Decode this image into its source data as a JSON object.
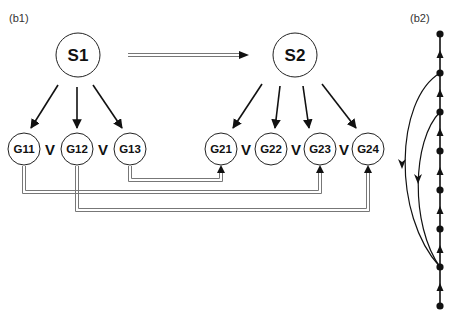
{
  "panels": {
    "b1": {
      "label": "(b1)"
    },
    "b2": {
      "label": "(b2)"
    }
  },
  "b1": {
    "states": [
      {
        "id": "S1",
        "label": "S1",
        "cx": 78,
        "cy": 55,
        "r": 22
      },
      {
        "id": "S2",
        "label": "S2",
        "cx": 295,
        "cy": 55,
        "r": 22
      }
    ],
    "goals": [
      {
        "id": "G11",
        "label": "G11",
        "cx": 24,
        "cy": 149,
        "r": 16,
        "parent": "S1"
      },
      {
        "id": "G12",
        "label": "G12",
        "cx": 77,
        "cy": 149,
        "r": 16,
        "parent": "S1"
      },
      {
        "id": "G13",
        "label": "G13",
        "cx": 130,
        "cy": 149,
        "r": 16,
        "parent": "S1"
      },
      {
        "id": "G21",
        "label": "G21",
        "cx": 221,
        "cy": 149,
        "r": 16,
        "parent": "S2"
      },
      {
        "id": "G22",
        "label": "G22",
        "cx": 271,
        "cy": 149,
        "r": 16,
        "parent": "S2"
      },
      {
        "id": "G23",
        "label": "G23",
        "cx": 320,
        "cy": 149,
        "r": 16,
        "parent": "S2"
      },
      {
        "id": "G24",
        "label": "G24",
        "cx": 368,
        "cy": 149,
        "r": 16,
        "parent": "S2"
      }
    ],
    "or_separators": [
      {
        "label": "V",
        "x": 50,
        "y": 155
      },
      {
        "label": "V",
        "x": 103,
        "y": 155
      },
      {
        "label": "V",
        "x": 246,
        "y": 155
      },
      {
        "label": "V",
        "x": 296,
        "y": 155
      },
      {
        "label": "V",
        "x": 344,
        "y": 155
      }
    ],
    "transition_arrow": {
      "from": "S1",
      "to": "S2"
    },
    "mappings": [
      {
        "from": "G13",
        "to": "G21"
      },
      {
        "from": "G11",
        "to": "G23"
      },
      {
        "from": "G12",
        "to": "G24"
      }
    ]
  },
  "b2": {
    "node_count": 8,
    "node_x": 440,
    "node_y": [
      34,
      73,
      112,
      151,
      190,
      229,
      267,
      306
    ],
    "back_arcs": [
      {
        "from_node": 1,
        "to_node": 6
      },
      {
        "from_node": 2,
        "to_node": 6
      }
    ]
  },
  "colors": {
    "ink": "#111111",
    "double_line": "#777777",
    "circle_stroke": "#222222"
  }
}
